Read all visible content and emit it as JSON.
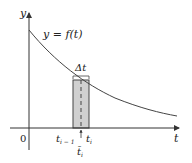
{
  "figure": {
    "type": "riemann-rectangle-diagram",
    "axes": {
      "y_label": "y",
      "x_label": "t",
      "origin_label": "0"
    },
    "curve": {
      "label": "y = f(t)",
      "shape": "decreasing convex (exponential-like decay)"
    },
    "rectangle": {
      "width_label": "Δt",
      "left_label": "t",
      "left_subscript": "i − 1",
      "right_label": "t",
      "right_subscript": "i",
      "sample_label": "t̄",
      "sample_subscript": "i",
      "fill_color": "#d0d0d0",
      "sample_line": "dashed"
    },
    "colors": {
      "axis": "#333333",
      "curve": "#444444",
      "rect_fill": "#d0d0d0",
      "rect_stroke": "#444444"
    }
  }
}
